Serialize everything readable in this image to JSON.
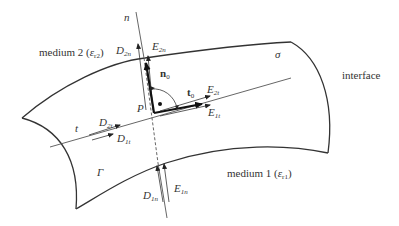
{
  "diagram": {
    "labels": {
      "normal_axis": "n",
      "tangent_axis": "t",
      "point": "P",
      "surface_charge": "σ",
      "contour": "Γ",
      "interface": "interface",
      "medium2": "medium 2 (",
      "medium2_eps": "ε",
      "medium2_sub": "r2",
      "medium2_close": ")",
      "medium1": "medium 1 (",
      "medium1_eps": "ε",
      "medium1_sub": "r1",
      "medium1_close": ")",
      "n0": "n",
      "n0_sub": "0",
      "t0": "t",
      "t0_sub": "0",
      "D2n": "D",
      "D2n_sub": "2n",
      "E2n": "E",
      "E2n_sub": "2n",
      "D2t": "D",
      "D2t_sub": "2t",
      "D1t": "D",
      "D1t_sub": "1t",
      "E2t": "E",
      "E2t_sub": "2t",
      "E1t": "E",
      "E1t_sub": "1t",
      "D1n": "D",
      "D1n_sub": "1n",
      "E1n": "E",
      "E1n_sub": "1n"
    },
    "colors": {
      "stroke": "#333333",
      "thin": "#555555",
      "background": "#ffffff"
    }
  }
}
